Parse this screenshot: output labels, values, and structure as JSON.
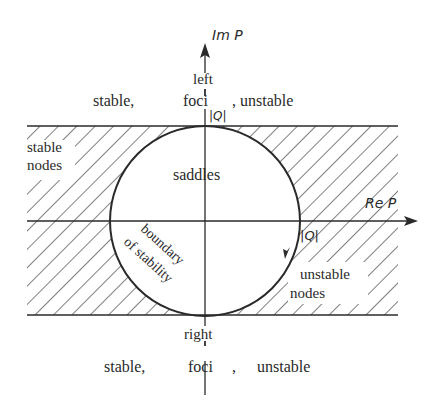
{
  "diagram": {
    "axes": {
      "y_label": "Im P",
      "x_label": "Re P",
      "radius_label_top": "|Q|",
      "radius_label_right": "|Q|"
    },
    "regions": {
      "top_left_word": "left",
      "top_stable": "stable,",
      "top_foci": "foci",
      "top_unstable": ", unstable",
      "stable_nodes_line1": "stable",
      "stable_nodes_line2": "nodes",
      "saddles": "saddles",
      "boundary_line1": "boundary",
      "boundary_line2": "of stability",
      "unstable_nodes_line1": "unstable",
      "unstable_nodes_line2": "nodes",
      "bottom_right_word": "right",
      "bottom_stable": "stable,",
      "bottom_foci": "foci",
      "bottom_comma": ",",
      "bottom_unstable": "unstable"
    },
    "colors": {
      "ink": "#2a2a2a",
      "background": "#ffffff"
    }
  }
}
